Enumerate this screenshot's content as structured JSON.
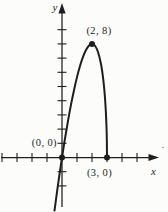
{
  "figure": {
    "background": "#fcfcfa",
    "ink_color": "#1e1e1e"
  },
  "chart_data": {
    "type": "line",
    "title": "",
    "xlabel": "x",
    "ylabel": "y",
    "grid": false,
    "x_tick_step": 1,
    "y_tick_step": 1,
    "x_ticks": [
      -4,
      -3,
      -2,
      -1,
      1,
      2,
      3,
      4,
      5
    ],
    "y_ticks": [
      -2,
      -1,
      1,
      2,
      3,
      4,
      5,
      6,
      7,
      8,
      9
    ],
    "x_range_shown": [
      -4,
      6
    ],
    "y_range_shown": [
      -3.8,
      10
    ],
    "axis_labels": {
      "x": "x",
      "y": "y"
    },
    "curve_points": [
      [
        -0.5,
        -3.74
      ],
      [
        -0.3,
        -2.18
      ],
      [
        -0.15,
        -1.07
      ],
      [
        0,
        0
      ],
      [
        0.2,
        1.34
      ],
      [
        0.4,
        2.58
      ],
      [
        0.6,
        3.72
      ],
      [
        0.8,
        4.74
      ],
      [
        1.0,
        5.66
      ],
      [
        1.2,
        6.44
      ],
      [
        1.4,
        7.08
      ],
      [
        1.6,
        7.57
      ],
      [
        1.8,
        7.89
      ],
      [
        2.0,
        8.0
      ],
      [
        2.2,
        7.87
      ],
      [
        2.4,
        7.43
      ],
      [
        2.6,
        6.58
      ],
      [
        2.75,
        5.5
      ],
      [
        2.85,
        4.42
      ],
      [
        2.92,
        3.3
      ],
      [
        2.97,
        2.06
      ],
      [
        2.99,
        1.2
      ],
      [
        3.0,
        0
      ]
    ],
    "labeled_points": [
      {
        "label": "(0, 0)",
        "x": 0,
        "y": 0,
        "label_position": "above-left"
      },
      {
        "label": "(2, 8)",
        "x": 2,
        "y": 8,
        "label_position": "above"
      },
      {
        "label": "(3, 0)",
        "x": 3,
        "y": 0,
        "label_position": "below"
      }
    ]
  }
}
